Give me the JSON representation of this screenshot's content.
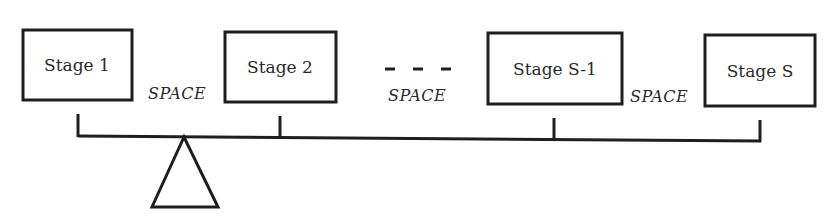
{
  "diagram": {
    "type": "balance-beam",
    "stages": [
      {
        "label": "Stage 1",
        "box": [
          23,
          30,
          109,
          70
        ],
        "tick_x": 78
      },
      {
        "label": "Stage 2",
        "box": [
          225,
          32,
          111,
          70
        ],
        "tick_x": 280
      },
      {
        "label": "Stage S-1",
        "box": [
          488,
          33,
          134,
          71
        ],
        "tick_x": 554
      },
      {
        "label": "Stage S",
        "box": [
          705,
          35,
          110,
          71
        ],
        "tick_x": 760
      }
    ],
    "spaces": [
      {
        "label": "SPACE",
        "x": 148,
        "y": 99
      },
      {
        "label": "SPACE",
        "x": 388,
        "y": 101
      },
      {
        "label": "SPACE",
        "x": 630,
        "y": 102
      }
    ],
    "ellipsis": "- - -",
    "beam": {
      "x1": 78,
      "y1": 136,
      "x2": 760,
      "y2": 141
    },
    "fulcrum": {
      "apex": [
        184,
        137
      ],
      "base_left": [
        152,
        207
      ],
      "base_right": [
        218,
        207
      ]
    }
  }
}
